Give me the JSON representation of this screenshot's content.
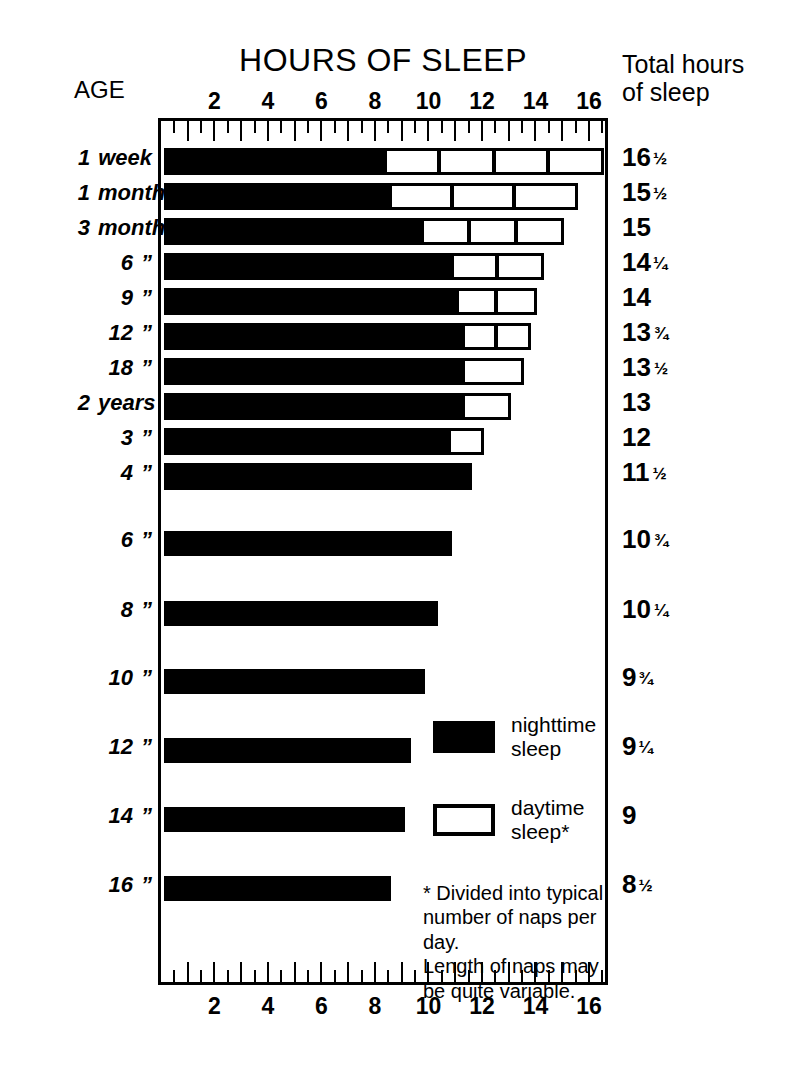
{
  "titles": {
    "chart_title": "HOURS OF SLEEP",
    "age_header": "AGE",
    "total_header_line1": "Total hours",
    "total_header_line2": "of sleep"
  },
  "legend": {
    "night_label_line1": "nighttime",
    "night_label_line2": "sleep",
    "day_label_line1": "daytime",
    "day_label_line2": "sleep*",
    "night_color": "#000000",
    "day_color": "#ffffff"
  },
  "footnote": {
    "line1": "* Divided into typical",
    "line2": "number of naps per day.",
    "line3": "Length of naps may",
    "line4": "be quite variable."
  },
  "axis": {
    "ticks": [
      "2",
      "4",
      "6",
      "8",
      "10",
      "12",
      "14",
      "16"
    ],
    "min": 0,
    "max": 16.6
  },
  "chart_data": {
    "type": "bar",
    "title": "HOURS OF SLEEP",
    "xlabel": "Hours of sleep",
    "ylabel": "Age",
    "xlim": [
      0,
      16.6
    ],
    "grid": false,
    "orientation": "horizontal",
    "stacked": true,
    "legend_position": "inside-lower-right",
    "series": [
      {
        "name": "nighttime sleep",
        "color": "#000000"
      },
      {
        "name": "daytime sleep*",
        "color": "#ffffff"
      }
    ],
    "categories": [
      "1 week",
      "1 month",
      "3 months",
      "6 ”",
      "9 ”",
      "12 ”",
      "18 ”",
      "2 years",
      "3 ”",
      "4 ”",
      "6 ”",
      "8 ”",
      "10 ”",
      "12 ”",
      "14 ”",
      "16 ”"
    ],
    "rows": [
      {
        "age_num": "1",
        "age_unit": "week",
        "night": 8.3,
        "naps": 4,
        "nap_total": 8.2,
        "total_label": "16",
        "total_fraction": "½",
        "total_value": 16.5
      },
      {
        "age_num": "1",
        "age_unit": "month",
        "night": 8.5,
        "naps": 3,
        "nap_total": 7.0,
        "total_label": "15",
        "total_fraction": "½",
        "total_value": 15.5
      },
      {
        "age_num": "3",
        "age_unit": "months",
        "night": 9.7,
        "naps": 3,
        "nap_total": 5.3,
        "total_label": "15",
        "total_fraction": "",
        "total_value": 15
      },
      {
        "age_num": "6",
        "age_unit": "”",
        "night": 10.8,
        "naps": 2,
        "nap_total": 3.45,
        "total_label": "14",
        "total_fraction": "¼",
        "total_value": 14.25
      },
      {
        "age_num": "9",
        "age_unit": "”",
        "night": 11.0,
        "naps": 2,
        "nap_total": 3.0,
        "total_label": "14",
        "total_fraction": "",
        "total_value": 14
      },
      {
        "age_num": "12",
        "age_unit": "”",
        "night": 11.2,
        "naps": 2,
        "nap_total": 2.55,
        "total_label": "13",
        "total_fraction": "¾",
        "total_value": 13.75
      },
      {
        "age_num": "18",
        "age_unit": "”",
        "night": 11.2,
        "naps": 1,
        "nap_total": 2.3,
        "total_label": "13",
        "total_fraction": "½",
        "total_value": 13.5
      },
      {
        "age_num": "2",
        "age_unit": "years",
        "night": 11.2,
        "naps": 1,
        "nap_total": 1.8,
        "total_label": "13",
        "total_fraction": "",
        "total_value": 13
      },
      {
        "age_num": "3",
        "age_unit": "”",
        "night": 10.7,
        "naps": 1,
        "nap_total": 1.3,
        "total_label": "12",
        "total_fraction": "",
        "total_value": 12
      },
      {
        "age_num": "4",
        "age_unit": "”",
        "night": 11.5,
        "naps": 0,
        "nap_total": 0,
        "total_label": "11",
        "total_fraction": "½",
        "total_value": 11.5
      },
      {
        "age_num": "6",
        "age_unit": "”",
        "night": 10.75,
        "naps": 0,
        "nap_total": 0,
        "total_label": "10",
        "total_fraction": "¾",
        "total_value": 10.75
      },
      {
        "age_num": "8",
        "age_unit": "”",
        "night": 10.25,
        "naps": 0,
        "nap_total": 0,
        "total_label": "10",
        "total_fraction": "¼",
        "total_value": 10.25
      },
      {
        "age_num": "10",
        "age_unit": "”",
        "night": 9.75,
        "naps": 0,
        "nap_total": 0,
        "total_label": "9",
        "total_fraction": "¾",
        "total_value": 9.75
      },
      {
        "age_num": "12",
        "age_unit": "”",
        "night": 9.25,
        "naps": 0,
        "nap_total": 0,
        "total_label": "9",
        "total_fraction": "¼",
        "total_value": 9.25
      },
      {
        "age_num": "14",
        "age_unit": "”",
        "night": 9.0,
        "naps": 0,
        "nap_total": 0,
        "total_label": "9",
        "total_fraction": "",
        "total_value": 9
      },
      {
        "age_num": "16",
        "age_unit": "”",
        "night": 8.5,
        "naps": 0,
        "nap_total": 0,
        "total_label": "8",
        "total_fraction": "½",
        "total_value": 8.5
      }
    ]
  }
}
